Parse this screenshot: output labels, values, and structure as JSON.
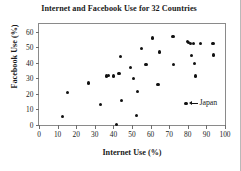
{
  "chart_data": {
    "type": "scatter",
    "title": "Internet and Facebook Use for 32 Countries",
    "xlabel": "Internet Use (%)",
    "ylabel": "Facebook Use (%)",
    "xlim": [
      0,
      100
    ],
    "ylim": [
      0,
      65
    ],
    "grid": false,
    "legend": "none",
    "xticks": [
      0,
      10,
      20,
      30,
      40,
      50,
      60,
      70,
      80,
      90,
      100
    ],
    "xticklabels": [
      "0",
      "10",
      "20",
      "30",
      "40",
      "50",
      "60",
      "70",
      "80",
      "90",
      "100"
    ],
    "yticks": [
      0,
      10,
      20,
      30,
      40,
      50,
      60
    ],
    "yticklabels": [
      "0",
      "10",
      "20",
      "30",
      "40",
      "50",
      "60"
    ],
    "n_points": 32,
    "points": [
      {
        "x": 12.5,
        "y": 5.5
      },
      {
        "x": 15.5,
        "y": 21.0
      },
      {
        "x": 26.5,
        "y": 27.0
      },
      {
        "x": 33.0,
        "y": 13.0
      },
      {
        "x": 36.5,
        "y": 31.5
      },
      {
        "x": 37.5,
        "y": 32.0
      },
      {
        "x": 40.0,
        "y": 31.5
      },
      {
        "x": 41.5,
        "y": 0.5
      },
      {
        "x": 43.0,
        "y": 33.0
      },
      {
        "x": 44.0,
        "y": 44.0
      },
      {
        "x": 44.5,
        "y": 15.8
      },
      {
        "x": 49.0,
        "y": 37.0
      },
      {
        "x": 51.0,
        "y": 30.0
      },
      {
        "x": 52.5,
        "y": 6.0
      },
      {
        "x": 53.0,
        "y": 21.3
      },
      {
        "x": 55.0,
        "y": 49.0
      },
      {
        "x": 57.5,
        "y": 39.0
      },
      {
        "x": 61.0,
        "y": 56.0
      },
      {
        "x": 64.0,
        "y": 26.3
      },
      {
        "x": 65.0,
        "y": 47.0
      },
      {
        "x": 72.0,
        "y": 57.0
      },
      {
        "x": 72.5,
        "y": 39.0
      },
      {
        "x": 79.0,
        "y": 14.0
      },
      {
        "x": 80.0,
        "y": 53.5
      },
      {
        "x": 80.5,
        "y": 53.0
      },
      {
        "x": 81.5,
        "y": 52.5
      },
      {
        "x": 82.0,
        "y": 44.5
      },
      {
        "x": 83.0,
        "y": 52.5
      },
      {
        "x": 83.5,
        "y": 39.5
      },
      {
        "x": 84.0,
        "y": 31.5
      },
      {
        "x": 87.0,
        "y": 52.5
      },
      {
        "x": 93.5,
        "y": 52.5
      },
      {
        "x": 94.0,
        "y": 45.0
      }
    ],
    "annotations": [
      {
        "label": "Japan",
        "point_x": 79.0,
        "point_y": 14.0,
        "arrow": "left-arrow-icon"
      }
    ]
  }
}
